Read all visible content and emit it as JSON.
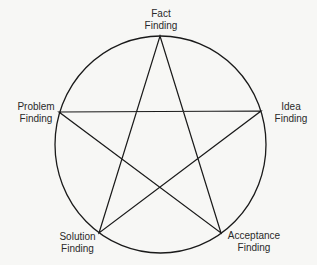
{
  "diagram": {
    "type": "pentagram-in-circle",
    "stroke_color": "#1a1a1a",
    "background": "#f7f7f5",
    "nodes": [
      {
        "id": "fact",
        "line1": "Fact",
        "line2": "Finding"
      },
      {
        "id": "idea",
        "line1": "Idea",
        "line2": "Finding"
      },
      {
        "id": "acceptance",
        "line1": "Acceptance",
        "line2": "Finding"
      },
      {
        "id": "solution",
        "line1": "Solution",
        "line2": "Finding"
      },
      {
        "id": "problem",
        "line1": "Problem",
        "line2": "Finding"
      }
    ]
  }
}
